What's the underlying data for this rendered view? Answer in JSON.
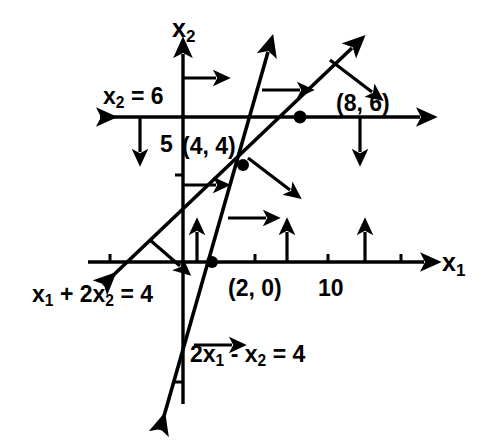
{
  "figure": {
    "type": "linear-programming-constraint-diagram",
    "background": "#ffffff",
    "ink_color": "#000000",
    "width": 493,
    "height": 447
  },
  "axes": {
    "x_axis_label": "x1",
    "x_axis_label_base": "x",
    "x_axis_label_sub": "1",
    "y_axis_label_base": "x",
    "y_axis_label_sub": "2",
    "origin_px": [
      183,
      262
    ],
    "units_per_px": 14.5,
    "x_ticks": [
      5,
      10,
      15
    ],
    "x_tick_labels": [
      "",
      "10",
      ""
    ],
    "y_ticks": [
      5,
      -5
    ],
    "y_tick_labels": [
      "5",
      ""
    ]
  },
  "tick_labels": {
    "ten": "10",
    "five": "5"
  },
  "lines": [
    {
      "name": "x2 = 6",
      "label_base_1": "x",
      "label_sub_1": "2",
      "label_rest": " = 6",
      "equation": "x2 = 6",
      "orientation": "horizontal",
      "value": 6,
      "feasible_direction": "down"
    },
    {
      "name": "x1 + 2x2 = 4",
      "label_parts": [
        "x",
        "1",
        " + 2",
        "x",
        "2",
        " = 4"
      ],
      "equation": "x1 + 2x2 = 4",
      "slope": -0.5,
      "intercept": 2,
      "feasible_direction": "up-right"
    },
    {
      "name": "2x1 - x2 = 4",
      "label_parts": [
        "2",
        "x",
        "1",
        " - ",
        "x",
        "2",
        " = 4"
      ],
      "equation": "2x1 - x2 = 4",
      "slope": 2,
      "intercept": -4,
      "feasible_direction": "right"
    }
  ],
  "equation_labels": {
    "line_x2_eq_6": "x2 = 6",
    "line_sum": "x1 + 2x2 = 4",
    "line_steep": "2x1 - x2 = 4"
  },
  "points": [
    {
      "label": "(4, 4)",
      "x": 4,
      "y": 4,
      "px": [
        243,
        165
      ],
      "marked": true
    },
    {
      "label": "(8, 6)",
      "x": 8,
      "y": 6,
      "px": [
        300,
        117
      ],
      "marked": true
    },
    {
      "label": "(2, 0)",
      "x": 2,
      "y": 0,
      "px": [
        212,
        262
      ],
      "marked": true
    }
  ],
  "point_labels": {
    "p44": "(4, 4)",
    "p86": "(8, 6)",
    "p20": "(2, 0)"
  }
}
